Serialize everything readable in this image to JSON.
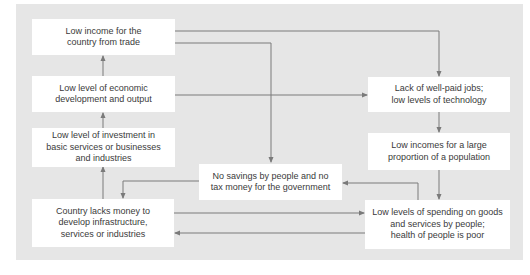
{
  "diagram": {
    "type": "cycle-of-poverty-flowchart",
    "colors": {
      "panel": "#e6e6e6",
      "box": "#ffffff",
      "text": "#3a3a3a",
      "arrow": "#7a7a7a"
    },
    "nodes": {
      "low_income_trade": "Low income for the\ncountry from trade",
      "low_development": "Low level of economic\ndevelopment and output",
      "low_investment": "Low level of investment in\nbasic services or businesses\nand industries",
      "lacks_money": "Country lacks money to\ndevelop infrastructure,\nservices or industries",
      "no_savings": "No savings by people and no\ntax money for the government",
      "lack_jobs": "Lack of well-paid jobs;\nlow levels of technology",
      "low_incomes_population": "Low incomes for a large\nproportion of a population",
      "low_spending": "Low levels of spending on goods\nand services by people;\nhealth of people is poor"
    },
    "edges": [
      {
        "from": "low_income_trade",
        "to": "lack_jobs"
      },
      {
        "from": "low_income_trade",
        "to": "no_savings"
      },
      {
        "from": "low_development",
        "to": "low_income_trade"
      },
      {
        "from": "low_development",
        "to": "lack_jobs"
      },
      {
        "from": "low_investment",
        "to": "low_development"
      },
      {
        "from": "lacks_money",
        "to": "low_investment"
      },
      {
        "from": "lacks_money",
        "to": "low_spending"
      },
      {
        "from": "no_savings",
        "to": "lacks_money"
      },
      {
        "from": "lack_jobs",
        "to": "low_incomes_population"
      },
      {
        "from": "low_incomes_population",
        "to": "low_spending"
      },
      {
        "from": "low_spending",
        "to": "no_savings"
      },
      {
        "from": "low_spending",
        "to": "lacks_money"
      }
    ]
  }
}
